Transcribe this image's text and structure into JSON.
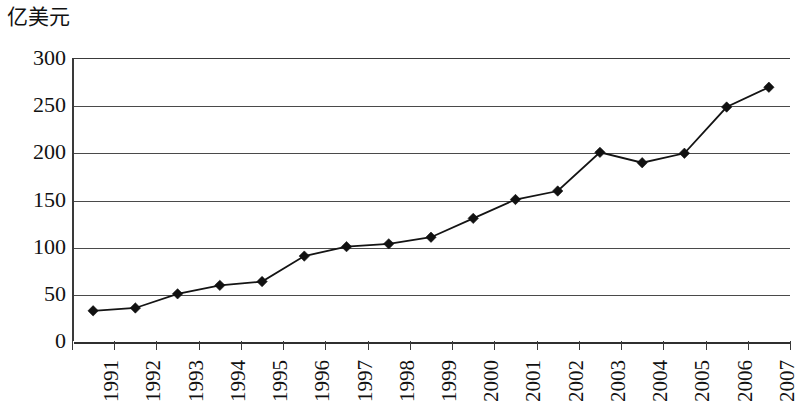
{
  "chart_data": {
    "type": "line",
    "title": "",
    "subtitle": "",
    "xlabel": "",
    "ylabel": "亿美元",
    "ylim": [
      0,
      300
    ],
    "yticks": [
      0,
      50,
      100,
      150,
      200,
      250,
      300
    ],
    "ytick_labels": [
      "0",
      "50",
      "100",
      "150",
      "200",
      "250",
      "300"
    ],
    "grid": true,
    "legend": "none",
    "categories": [
      "1991",
      "1992",
      "1993",
      "1994",
      "1995",
      "1996",
      "1997",
      "1998",
      "1999",
      "2000",
      "2001",
      "2002",
      "2003",
      "2004",
      "2005",
      "2006",
      "2007"
    ],
    "values": [
      32,
      35,
      50,
      59,
      63,
      90,
      100,
      103,
      110,
      130,
      150,
      159,
      200,
      189,
      199,
      248,
      269
    ],
    "series": [
      {
        "name": "亿美元",
        "marker": "diamond",
        "color": "#111111",
        "values": [
          32,
          35,
          50,
          59,
          63,
          90,
          100,
          103,
          110,
          130,
          150,
          159,
          200,
          189,
          199,
          248,
          269
        ]
      }
    ]
  },
  "axis": {
    "y_unit_label": "亿美元",
    "y_tick_labels": [
      "300",
      "250",
      "200",
      "150",
      "100",
      "50",
      "0"
    ],
    "x_tick_labels": [
      "1991",
      "1992",
      "1993",
      "1994",
      "1995",
      "1996",
      "1997",
      "1998",
      "1999",
      "2000",
      "2001",
      "2002",
      "2003",
      "2004",
      "2005",
      "2006",
      "2007"
    ]
  },
  "style": {
    "line_color": "#111111",
    "marker_color": "#111111",
    "grid_color": "#4a4a4a",
    "background": "#ffffff"
  }
}
